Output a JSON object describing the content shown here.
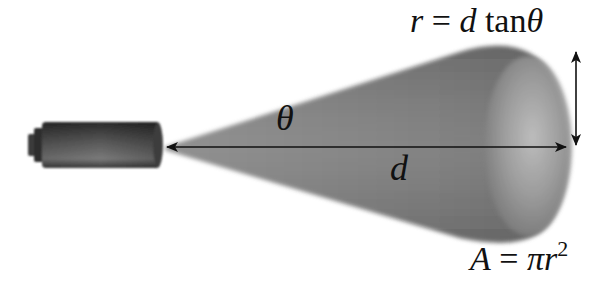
{
  "diagram": {
    "labels": {
      "angle": "θ",
      "distance": "d",
      "radius_lhs": "r",
      "radius_eq": " = ",
      "radius_d": "d",
      "radius_tan": " tan",
      "radius_theta": "θ",
      "area_lhs": "A",
      "area_eq": " = ",
      "area_pi": "π",
      "area_r": "r",
      "area_exp": "2"
    },
    "formulas": {
      "radius": "r = d tanθ",
      "area": "A = πr^2"
    },
    "elements": [
      "flashlight",
      "light-cone",
      "distance-arrow",
      "radius-arrow"
    ],
    "colors": {
      "flashlight_dark": "#2a2a2a",
      "flashlight_mid": "#6e6e6e",
      "cone_dark": "#707070",
      "cone_mid": "#8c8c8c",
      "cone_light": "#b4b4b4",
      "arrow": "#111111",
      "background": "#ffffff"
    }
  }
}
